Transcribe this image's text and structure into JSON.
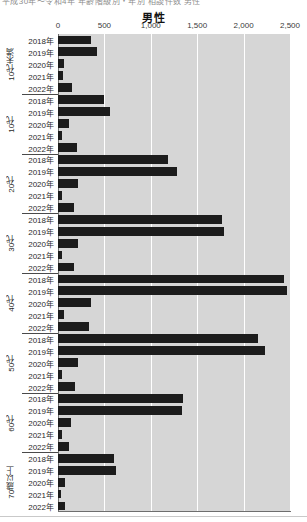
{
  "header": {
    "clipped_fragment": "平成30年〜令和4年 年齢階級別・年別 相談件数 男性"
  },
  "chart_data": {
    "type": "bar",
    "orientation": "horizontal",
    "title": "男性",
    "xlabel": "",
    "ylabel": "",
    "xlim": [
      0,
      2500
    ],
    "xticks": [
      0,
      500,
      1000,
      1500,
      2000,
      2500
    ],
    "xticklabels": [
      "0",
      "500",
      "1,000",
      "1,500",
      "2,000",
      "2,500"
    ],
    "grid": true,
    "legend": "none",
    "bar_color": "#1c1c1c",
    "plot_background": "#d6d6d6",
    "year_labels": [
      "2018年",
      "2019年",
      "2020年",
      "2021年",
      "2022年"
    ],
    "groups": [
      {
        "name": "10代未満",
        "values": [
          355,
          420,
          70,
          55,
          150
        ]
      },
      {
        "name": "10代",
        "values": [
          500,
          565,
          120,
          40,
          205
        ]
      },
      {
        "name": "20代",
        "values": [
          1180,
          1280,
          215,
          40,
          175
        ]
      },
      {
        "name": "30代",
        "values": [
          1770,
          1790,
          215,
          45,
          170
        ]
      },
      {
        "name": "40代",
        "values": [
          2440,
          2470,
          355,
          70,
          330
        ]
      },
      {
        "name": "50代",
        "values": [
          2150,
          2230,
          220,
          40,
          180
        ]
      },
      {
        "name": "60代",
        "values": [
          1345,
          1340,
          135,
          40,
          115
        ]
      },
      {
        "name": "70歳以上",
        "values": [
          600,
          625,
          80,
          35,
          75
        ]
      }
    ]
  }
}
